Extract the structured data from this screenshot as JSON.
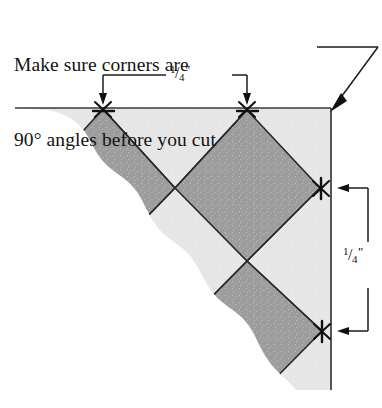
{
  "figure": {
    "type": "instructional-diagram",
    "caption": {
      "line1": "Make sure corners are",
      "line2": "90° angles before you cut"
    },
    "dimensions": {
      "top": {
        "numerator": "1",
        "slash": "/",
        "denominator": "4",
        "unit": "\"",
        "plain": "1/4\"",
        "orientation": "horizontal",
        "measures": "distance between seam intersections along top cut edge"
      },
      "right": {
        "numerator": "1",
        "slash": "/",
        "denominator": "4",
        "unit": "\"",
        "plain": "1/4\"",
        "orientation": "vertical",
        "measures": "distance between seam intersections along right cut edge"
      }
    },
    "colors": {
      "dark_patch": "#9d9d9d",
      "light_patch": "#e7e7e7",
      "seam_line": "#2a2a2a",
      "cut_line": "#3a3a3a",
      "leader_line": "#2a2a2a",
      "background": "#ffffff",
      "text": "#131313"
    },
    "annotations": {
      "leader_target": "top-right corner of block",
      "marker_symbol": "x",
      "marker_meaning": "seam intersection point"
    },
    "seam_markers": [
      {
        "name": "top-left-marker",
        "x": 103,
        "y": 109
      },
      {
        "name": "top-right-marker",
        "x": 247,
        "y": 109
      },
      {
        "name": "right-upper-marker",
        "x": 320,
        "y": 188
      },
      {
        "name": "right-lower-marker",
        "x": 322,
        "y": 331
      }
    ]
  }
}
